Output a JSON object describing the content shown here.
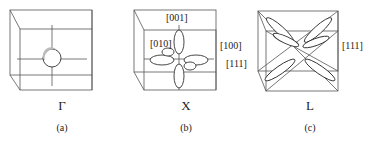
{
  "panels": [
    {
      "id": "a",
      "symbol": "Γ",
      "caption": "(a)"
    },
    {
      "id": "b",
      "symbol": "X",
      "caption": "(b)",
      "labels": {
        "top": "[001]",
        "left": "[010]",
        "right": "[100]"
      }
    },
    {
      "id": "c",
      "symbol": "L",
      "caption": "(c)",
      "labels": {
        "right": "[111]",
        "left": "[111]"
      }
    }
  ]
}
